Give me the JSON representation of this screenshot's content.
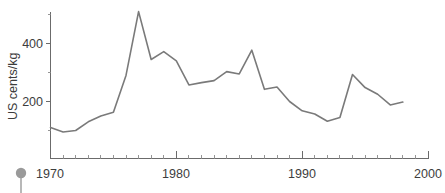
{
  "chart_data": {
    "type": "line",
    "title": "",
    "subtitle": "",
    "xlabel": "",
    "ylabel": "US cents/kg",
    "xlim": [
      1970,
      2000
    ],
    "ylim": [
      0,
      560
    ],
    "grid": false,
    "legend": null,
    "x_ticks_labeled": [
      "1970",
      "1980",
      "1990",
      "2000"
    ],
    "x_tick_values": [
      1970,
      1980,
      1990,
      2000
    ],
    "x_minor_tick_step": 1,
    "y_ticks_labeled": [
      "200",
      "400"
    ],
    "y_tick_values": [
      200,
      400
    ],
    "y_minor_tick_values": [
      100,
      300,
      500
    ],
    "series": [
      {
        "name": "US cents/kg",
        "color": "#7a7a7a",
        "x": [
          1970,
          1971,
          1972,
          1973,
          1974,
          1975,
          1976,
          1977,
          1978,
          1979,
          1980,
          1981,
          1982,
          1983,
          1984,
          1985,
          1986,
          1987,
          1988,
          1989,
          1990,
          1991,
          1992,
          1993,
          1994,
          1995,
          1996,
          1997,
          1998
        ],
        "values": [
          110,
          95,
          100,
          130,
          150,
          163,
          290,
          510,
          345,
          372,
          340,
          257,
          265,
          272,
          303,
          295,
          377,
          242,
          250,
          200,
          168,
          157,
          132,
          145,
          293,
          248,
          225,
          188,
          198
        ]
      }
    ]
  },
  "axes": {
    "y_axis_title": "US cents/kg",
    "y_tick_400": "400",
    "y_tick_200": "200",
    "x_tick_1970": "1970",
    "x_tick_1980": "1980",
    "x_tick_1990": "1990",
    "x_tick_2000": "2000"
  },
  "decoration": {
    "marker_name": "pin-marker",
    "marker_color": "#9a9a9a"
  },
  "colors": {
    "line": "#7a7a7a",
    "axis": "#6b6b6b",
    "text": "#3d3d3d",
    "background": "#ffffff"
  }
}
